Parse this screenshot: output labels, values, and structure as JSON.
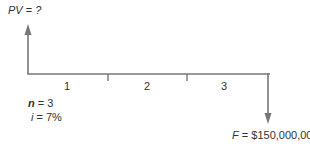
{
  "diagram": {
    "type": "cash-flow-timeline",
    "top_label": {
      "var": "PV",
      "eq": " = ",
      "value": "?"
    },
    "periods": [
      "1",
      "2",
      "3"
    ],
    "params": {
      "n": {
        "var": "n",
        "eq": " = ",
        "value": "3"
      },
      "i": {
        "var": "i",
        "eq": " = ",
        "value": "7%"
      }
    },
    "bottom_label": {
      "var": "F",
      "eq": " = ",
      "value": "$150,000,000"
    },
    "colors": {
      "line": "#777777",
      "text": "#333333"
    }
  }
}
